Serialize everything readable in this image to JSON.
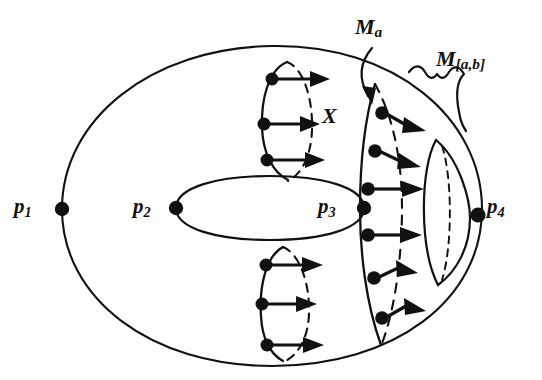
{
  "figure": {
    "domain": "Diagram",
    "kind": "mathematical-illustration",
    "background_color": "#fefefe",
    "ink_color": "#111111"
  },
  "labels": {
    "p1": {
      "base": "p",
      "sub": "1"
    },
    "p2": {
      "base": "p",
      "sub": "2"
    },
    "p3": {
      "base": "p",
      "sub": "3"
    },
    "p4": {
      "base": "p",
      "sub": "4"
    },
    "Ma": {
      "base": "M",
      "sub": "a"
    },
    "Mab": {
      "base": "M",
      "sub": "[a,b]"
    },
    "X": {
      "base": "X"
    }
  },
  "points": [
    {
      "name": "p1",
      "x": 62,
      "y": 209,
      "label": "p1"
    },
    {
      "name": "p2",
      "x": 176,
      "y": 208,
      "label": "p2"
    },
    {
      "name": "p3",
      "x": 364,
      "y": 208,
      "label": "p3"
    },
    {
      "name": "p4",
      "x": 478,
      "y": 215,
      "label": "p4"
    }
  ],
  "vector_field": {
    "symbol": "X",
    "direction": "rightward",
    "arrow_rows_upper_circle": 3,
    "arrow_rows_lower_circle": 3,
    "arrow_rows_Ma_curve": 6
  },
  "annotations": {
    "Ma_pointer": "arrow from M_a label down to top of the M_a level curve",
    "Mab_brace": "curly brace spanning the region to the right of M_a"
  }
}
